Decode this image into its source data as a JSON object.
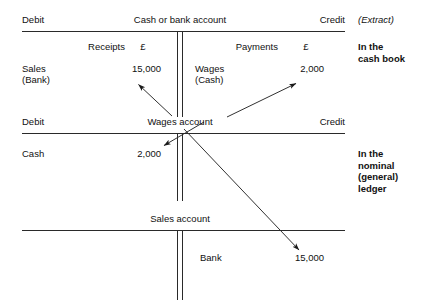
{
  "document": {
    "type": "double-entry-bookkeeping-t-accounts",
    "extract_note": "(Extract)"
  },
  "accounts": [
    {
      "id": "cash-or-bank",
      "title": "Cash or bank account",
      "debit_label": "Debit",
      "credit_label": "Credit",
      "debit_column_heading": "Receipts",
      "debit_currency_heading": "£",
      "credit_column_heading": "Payments",
      "credit_currency_heading": "£",
      "debit_entries": [
        {
          "narrative_line1": "Sales",
          "narrative_line2": "(Bank)",
          "amount": "15,000"
        }
      ],
      "credit_entries": [
        {
          "narrative_line1": "Wages",
          "narrative_line2": "(Cash)",
          "amount": "2,000"
        }
      ],
      "annotation": "In the\ncash book"
    },
    {
      "id": "wages",
      "title": "Wages account",
      "debit_label": "Debit",
      "credit_label": "Credit",
      "debit_entries": [
        {
          "narrative_line1": "Cash",
          "amount": "2,000"
        }
      ],
      "credit_entries": [],
      "annotation": "In the\nnominal\n(general)\nledger"
    },
    {
      "id": "sales",
      "title": "Sales account",
      "debit_label": "",
      "credit_label": "",
      "debit_entries": [],
      "credit_entries": [
        {
          "narrative_line1": "Bank",
          "amount": "15,000"
        }
      ],
      "annotation": ""
    }
  ],
  "postings": [
    {
      "id": "wages-to-cashbook-credit",
      "from": "Wages account title",
      "to": "Cash or bank account credit 2,000",
      "color": "#1a1a1a"
    },
    {
      "id": "wages-to-cashbook-debit",
      "from": "Wages account title",
      "to": "Cash or bank account debit 15,000",
      "color": "#1a1a1a"
    },
    {
      "id": "cashbook-to-wages-debit",
      "from": "Cash or bank account credit",
      "to": "Wages account debit 2,000",
      "color": "#1a1a1a"
    },
    {
      "id": "cashbook-to-sales-credit",
      "from": "Cash or bank account debit",
      "to": "Sales account credit 15,000",
      "color": "#1a1a1a"
    }
  ],
  "colors": {
    "rule": "#2a2a2a",
    "text": "#111111",
    "background": "#ffffff"
  }
}
